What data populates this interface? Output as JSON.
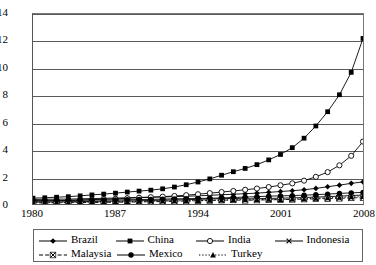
{
  "chart_data": {
    "type": "line",
    "title": "",
    "xlabel": "",
    "ylabel": "",
    "xlim": [
      1980,
      2008
    ],
    "ylim": [
      0,
      14
    ],
    "ytick_labels": [
      "0",
      "2",
      "4",
      "6",
      "8",
      "10",
      "12",
      "14"
    ],
    "ytick_values": [
      0,
      2,
      4,
      6,
      8,
      10,
      12,
      14
    ],
    "xtick_labels": [
      "1980",
      "1987",
      "1994",
      "2001",
      "2008"
    ],
    "xtick_values": [
      1980,
      1987,
      1994,
      2001,
      2008
    ],
    "grid": "horizontal",
    "legend_position": "bottom",
    "x": [
      1980,
      1981,
      1982,
      1983,
      1984,
      1985,
      1986,
      1987,
      1988,
      1989,
      1990,
      1991,
      1992,
      1993,
      1994,
      1995,
      1996,
      1997,
      1998,
      1999,
      2000,
      2001,
      2002,
      2003,
      2004,
      2005,
      2006,
      2007,
      2008
    ],
    "series": [
      {
        "name": "Brazil",
        "marker": "diamond",
        "line": "solid",
        "color": "#000000",
        "values": [
          0.33,
          0.35,
          0.36,
          0.36,
          0.38,
          0.4,
          0.42,
          0.44,
          0.46,
          0.49,
          0.5,
          0.52,
          0.54,
          0.57,
          0.6,
          0.64,
          0.68,
          0.72,
          0.76,
          0.8,
          0.86,
          0.92,
          0.98,
          1.05,
          1.15,
          1.27,
          1.39,
          1.52,
          1.63
        ]
      },
      {
        "name": "China",
        "marker": "square",
        "line": "solid",
        "color": "#000000",
        "values": [
          0.43,
          0.46,
          0.5,
          0.54,
          0.6,
          0.67,
          0.73,
          0.8,
          0.88,
          0.95,
          1.02,
          1.12,
          1.25,
          1.42,
          1.62,
          1.85,
          2.12,
          2.38,
          2.62,
          2.9,
          3.25,
          3.65,
          4.15,
          4.85,
          5.75,
          6.8,
          8.05,
          9.7,
          12.2
        ]
      },
      {
        "name": "India",
        "marker": "circle-open",
        "line": "solid",
        "color": "#000000",
        "values": [
          0.2,
          0.22,
          0.24,
          0.26,
          0.29,
          0.32,
          0.35,
          0.38,
          0.42,
          0.46,
          0.5,
          0.54,
          0.59,
          0.65,
          0.72,
          0.8,
          0.88,
          0.96,
          1.05,
          1.14,
          1.25,
          1.38,
          1.52,
          1.72,
          2.0,
          2.35,
          2.85,
          3.55,
          4.6
        ]
      },
      {
        "name": "Indonesia",
        "marker": "cross",
        "line": "solid",
        "color": "#000000",
        "values": [
          0.14,
          0.15,
          0.16,
          0.17,
          0.18,
          0.19,
          0.2,
          0.21,
          0.23,
          0.24,
          0.26,
          0.28,
          0.3,
          0.32,
          0.34,
          0.37,
          0.39,
          0.41,
          0.38,
          0.39,
          0.41,
          0.43,
          0.45,
          0.48,
          0.51,
          0.54,
          0.58,
          0.62,
          0.66
        ]
      },
      {
        "name": "Malaysia",
        "marker": "cross-box",
        "line": "dashed",
        "color": "#000000",
        "values": [
          0.08,
          0.09,
          0.09,
          0.1,
          0.11,
          0.11,
          0.12,
          0.13,
          0.14,
          0.15,
          0.17,
          0.18,
          0.2,
          0.22,
          0.24,
          0.26,
          0.28,
          0.3,
          0.27,
          0.29,
          0.31,
          0.32,
          0.34,
          0.36,
          0.38,
          0.4,
          0.42,
          0.45,
          0.47
        ]
      },
      {
        "name": "Mexico",
        "marker": "circle",
        "line": "solid",
        "color": "#000000",
        "values": [
          0.25,
          0.27,
          0.27,
          0.27,
          0.28,
          0.29,
          0.29,
          0.3,
          0.31,
          0.33,
          0.34,
          0.36,
          0.38,
          0.39,
          0.41,
          0.42,
          0.45,
          0.48,
          0.51,
          0.54,
          0.58,
          0.6,
          0.62,
          0.65,
          0.69,
          0.73,
          0.78,
          0.82,
          0.86
        ]
      },
      {
        "name": "Turkey",
        "marker": "triangle",
        "line": "dotted",
        "color": "#000000",
        "values": [
          0.11,
          0.12,
          0.13,
          0.13,
          0.14,
          0.15,
          0.16,
          0.17,
          0.18,
          0.19,
          0.21,
          0.22,
          0.23,
          0.25,
          0.25,
          0.27,
          0.29,
          0.31,
          0.32,
          0.32,
          0.35,
          0.33,
          0.36,
          0.38,
          0.42,
          0.45,
          0.49,
          0.52,
          0.54
        ]
      }
    ]
  }
}
